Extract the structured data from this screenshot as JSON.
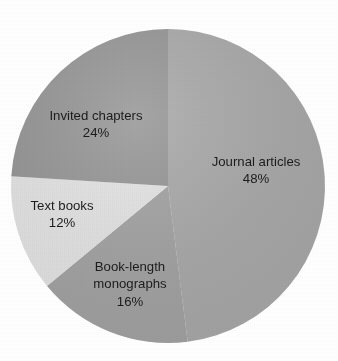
{
  "chart_data": {
    "type": "pie",
    "title": "",
    "subtitle": "",
    "xlabel": "",
    "ylabel": "",
    "legend_position": "none",
    "grid": false,
    "labels_on_slices": true,
    "start_angle_deg": 0,
    "direction": "clockwise",
    "categories": [
      "Journal articles",
      "Book-length monographs",
      "Text books",
      "Invited chapters"
    ],
    "values": [
      48,
      16,
      12,
      24
    ],
    "units": "%",
    "slices": [
      {
        "label": "Journal articles",
        "label_line1": "Journal articles",
        "label_line2": "48%",
        "value": 48,
        "value_text": "48%",
        "color": "#a9a9a9",
        "start_deg": 0,
        "end_deg": 172.8,
        "label_x": 256,
        "label_y": 171
      },
      {
        "label": "Book-length monographs",
        "label_line1": "Book-length",
        "label_line2": "monographs",
        "label_line3": "16%",
        "value": 16,
        "value_text": "16%",
        "color": "#a3a3a3",
        "start_deg": 172.8,
        "end_deg": 230.4,
        "label_x": 130,
        "label_y": 285
      },
      {
        "label": "Text books",
        "label_line1": "Text books",
        "label_line2": "12%",
        "value": 12,
        "value_text": "12%",
        "color": "#e6e6e6",
        "start_deg": 230.4,
        "end_deg": 273.6,
        "label_x": 62,
        "label_y": 215
      },
      {
        "label": "Invited chapters",
        "label_line1": "Invited chapters",
        "label_line2": "24%",
        "value": 24,
        "value_text": "24%",
        "color": "#959595",
        "start_deg": 273.6,
        "end_deg": 360,
        "label_x": 96,
        "label_y": 125
      }
    ],
    "geometry": {
      "center_x": 168,
      "center_y": 186,
      "radius": 157
    },
    "colors": {
      "background": "#ffffff",
      "text": "#1c1c1c",
      "journal_articles": "#a9a9a9",
      "book_length_monographs": "#a3a3a3",
      "text_books": "#e6e6e6",
      "invited_chapters": "#959595"
    }
  }
}
